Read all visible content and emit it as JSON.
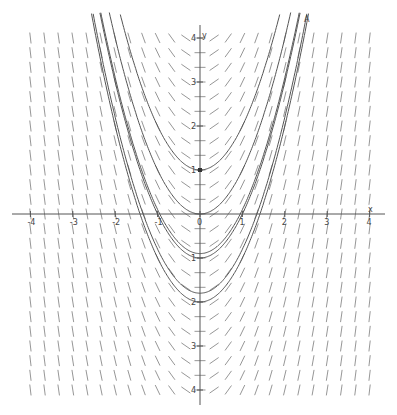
{
  "chart_data": {
    "type": "line",
    "title": "",
    "subtitle": "Slope field for dy/dx = 2x with solution curves y = x^2 + C",
    "xlabel": "x",
    "ylabel": "y",
    "xlim": [
      -4,
      4
    ],
    "ylim": [
      -4,
      4
    ],
    "x_ticks": [
      -4,
      -3,
      -2,
      -1,
      0,
      1,
      2,
      3,
      4
    ],
    "y_ticks": [
      -4,
      -3,
      -2,
      -1,
      0,
      1,
      2,
      3,
      4
    ],
    "grid": false,
    "slope_field": {
      "equation": "dy/dx = 2x",
      "step": 0.3333
    },
    "series": [
      {
        "name": "C=1",
        "C": 1
      },
      {
        "name": "C=0",
        "C": 0
      },
      {
        "name": "C=-0.9",
        "C": -0.9
      },
      {
        "name": "C=-1",
        "C": -1
      },
      {
        "name": "C=-1.8",
        "C": -1.8
      },
      {
        "name": "C=-2",
        "C": -2
      }
    ],
    "points": [
      {
        "label": "",
        "x": 0,
        "y": 1
      }
    ],
    "annotations": [
      {
        "text": "A",
        "x": 2.5,
        "y": 4.5
      }
    ]
  },
  "labels": {
    "x_axis": "x",
    "y_axis": "y",
    "point_a": "A"
  }
}
